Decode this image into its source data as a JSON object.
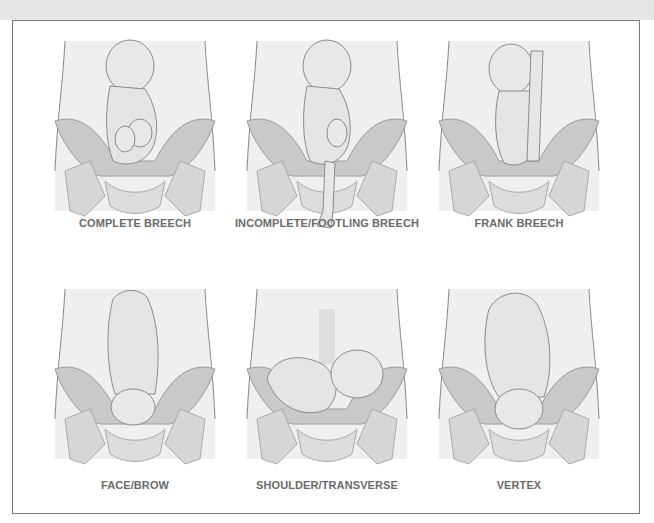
{
  "figure": {
    "panels": [
      {
        "id": "complete-breech",
        "label": "COMPLETE BREECH"
      },
      {
        "id": "incomplete-footling-breech",
        "label": "INCOMPLETE/FOOTLING BREECH"
      },
      {
        "id": "frank-breech",
        "label": "FRANK BREECH"
      },
      {
        "id": "face-brow",
        "label": "FACE/BROW"
      },
      {
        "id": "shoulder-transverse",
        "label": "SHOULDER/TRANSVERSE"
      },
      {
        "id": "vertex",
        "label": "VERTEX"
      }
    ]
  },
  "colors": {
    "outline": "#7a7a7a",
    "skin": "#e9e9e9",
    "bone": "#d4d4d4",
    "pelvis-bowl": "#c4c4c4",
    "caption": "#6b6b6b"
  }
}
